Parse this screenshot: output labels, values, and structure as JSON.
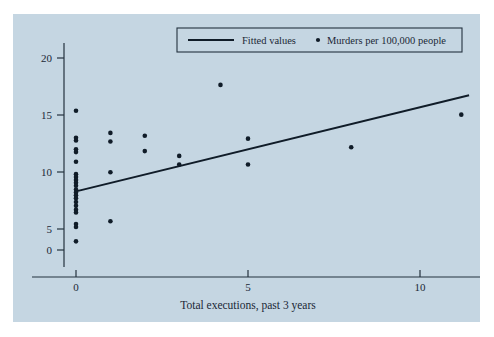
{
  "figure": {
    "background_color": "#c5d6e2",
    "ink_color": "#101c28",
    "page_background": "#ffffff"
  },
  "chart_data": {
    "type": "scatter",
    "title": "",
    "xlabel": "Total executions, past 3 years",
    "ylabel": "",
    "xlim": [
      -0.5,
      11.9
    ],
    "ylim": [
      -1.2,
      21.5
    ],
    "xticks": [
      0,
      5,
      10
    ],
    "xtick_labels": [
      "0",
      "5",
      "10"
    ],
    "yticks": [
      0,
      5,
      10,
      15,
      20
    ],
    "ytick_labels": [
      "0",
      "5",
      "10",
      "15",
      "20"
    ],
    "grid": false,
    "legend_position": "top-center",
    "series": [
      {
        "name": "Murders per 100,000 people",
        "type": "scatter",
        "marker": "filled-circle",
        "color": "#101c28",
        "points": [
          [
            0,
            14.5
          ],
          [
            0,
            11.7
          ],
          [
            0,
            11.4
          ],
          [
            0,
            10.5
          ],
          [
            0,
            10.2
          ],
          [
            0,
            9.2
          ],
          [
            0,
            7.9
          ],
          [
            0,
            7.6
          ],
          [
            0,
            7.3
          ],
          [
            0,
            7.0
          ],
          [
            0,
            6.7
          ],
          [
            0,
            6.3
          ],
          [
            0,
            6.0
          ],
          [
            0,
            5.7
          ],
          [
            0,
            5.4
          ],
          [
            0,
            5.0
          ],
          [
            0,
            4.6
          ],
          [
            0,
            4.2
          ],
          [
            0,
            3.9
          ],
          [
            0,
            2.7
          ],
          [
            0,
            2.4
          ],
          [
            0,
            0.9
          ],
          [
            1,
            12.2
          ],
          [
            1,
            11.3
          ],
          [
            1,
            8.1
          ],
          [
            1,
            3.0
          ],
          [
            2,
            11.9
          ],
          [
            2,
            10.3
          ],
          [
            3,
            9.8
          ],
          [
            3,
            8.9
          ],
          [
            4.2,
            17.2
          ],
          [
            5,
            11.6
          ],
          [
            5,
            8.9
          ],
          [
            8,
            10.7
          ],
          [
            11.2,
            14.1
          ]
        ]
      },
      {
        "name": "Fitted values",
        "type": "line",
        "color": "#101c28",
        "endpoints": [
          [
            0,
            6.1
          ],
          [
            11.4,
            16.1
          ]
        ],
        "slope": 0.877,
        "intercept": 6.1
      }
    ],
    "legend_entries": [
      {
        "label": "Fitted values",
        "marker": "line"
      },
      {
        "label": "Murders per 100,000 people",
        "marker": "dot"
      }
    ]
  }
}
